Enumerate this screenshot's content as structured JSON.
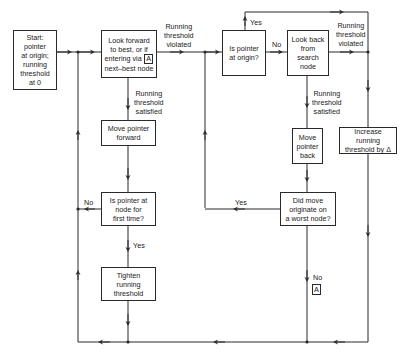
{
  "diagram": {
    "type": "flowchart",
    "nodes": {
      "start": "Start: pointer\nat origin;\nrunning\nthreshold\nat 0",
      "look_forward_pre": "Look forward\nto best, or if\nentering via",
      "look_forward_tag": "A",
      "look_forward_post": "next–best node",
      "is_origin": "Is pointer\nat origin?",
      "look_back": "Look back\nfrom\nsearch node",
      "increase": "Increase running\nthreshold by Δ",
      "move_forward": "Move pointer\nforward",
      "first_time": "Is pointer at\nnode for\nfirst time?",
      "tighten": "Tighten\nrunning\nthreshold",
      "move_back": "Move\npointer\nback",
      "worst_node": "Did move\noriginate on\na worst node?",
      "connector_a": "A"
    },
    "edge_labels": {
      "fwd_violated": "Running\nthreshold\nviolated",
      "fwd_satisfied": "Running\nthreshold\nsatisfied",
      "origin_yes": "Yes",
      "origin_no": "No",
      "back_violated": "Running\nthreshold\nviolated",
      "back_satisfied": "Running\nthreshold\nsatisfied",
      "first_no": "No",
      "first_yes": "Yes",
      "worst_yes": "Yes",
      "worst_no": "No"
    },
    "colors": {
      "line": "#2a2a2a",
      "background": "#ffffff"
    }
  }
}
